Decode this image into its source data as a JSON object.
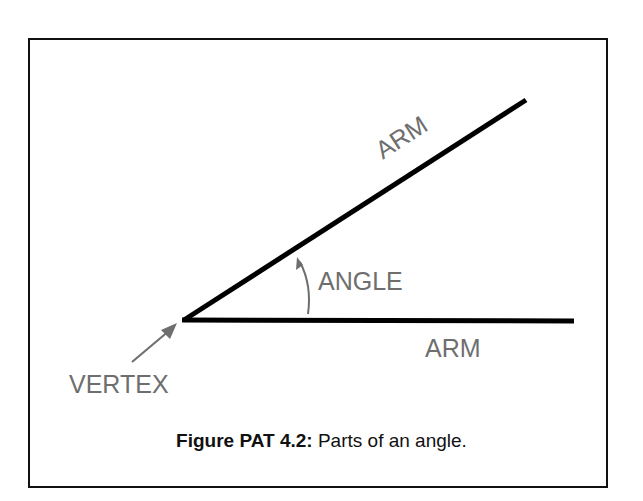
{
  "figure": {
    "labels": {
      "arm_upper": "ARM",
      "arm_lower": "ARM",
      "angle": "ANGLE",
      "vertex": "VERTEX"
    },
    "caption": {
      "prefix": "Figure PAT 4.2:",
      "text": " Parts of an angle."
    },
    "colors": {
      "lines": "#000000",
      "labels": "#6e6e6e",
      "border": "#111111"
    }
  }
}
